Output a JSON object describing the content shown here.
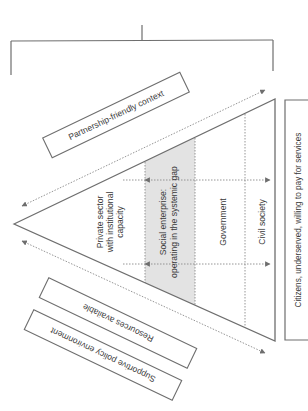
{
  "colors": {
    "line": "#6e6e6e",
    "text": "#3a3a3a",
    "shaded_band": "#e3e3e3",
    "background": "#ffffff"
  },
  "context_boxes": {
    "top": "Partnership-friendly context",
    "bottom_inner": "Resources available",
    "bottom_outer": "Supportive policy environment"
  },
  "triangle_columns": {
    "private_sector": [
      "Private sector",
      "with institutional",
      "capacity"
    ],
    "social_enterprise": [
      "Social enterprise:",
      "operating in the systemic gap"
    ],
    "government": "Government",
    "civil_society": "Civil society"
  },
  "citizens_box": "Citizens, underserved, willing to pay for services"
}
